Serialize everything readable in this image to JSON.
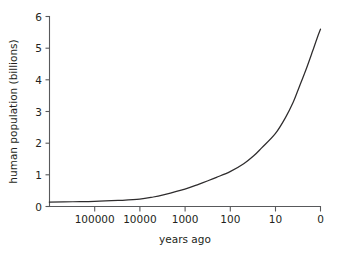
{
  "chart_data": {
    "type": "line",
    "title": "",
    "xlabel": "years ago",
    "ylabel": "human population (billions)",
    "x_scale": "log-reversed",
    "x_tick_labels": [
      "100000",
      "10000",
      "1000",
      "100",
      "10",
      "0"
    ],
    "x_tick_values": [
      100000,
      10000,
      1000,
      100,
      10,
      0
    ],
    "y_tick_labels": [
      "0",
      "1",
      "2",
      "3",
      "4",
      "5",
      "6"
    ],
    "y_tick_values": [
      0,
      1,
      2,
      3,
      4,
      5,
      6
    ],
    "ylim": [
      0,
      6
    ],
    "grid": false,
    "legend": "none",
    "series": [
      {
        "name": "human population",
        "units": "billions",
        "points": [
          {
            "years_ago": 1000000,
            "population": 0.14
          },
          {
            "years_ago": 300000,
            "population": 0.15
          },
          {
            "years_ago": 100000,
            "population": 0.16
          },
          {
            "years_ago": 30000,
            "population": 0.19
          },
          {
            "years_ago": 10000,
            "population": 0.23
          },
          {
            "years_ago": 5000,
            "population": 0.3
          },
          {
            "years_ago": 3000,
            "population": 0.37
          },
          {
            "years_ago": 1000,
            "population": 0.55
          },
          {
            "years_ago": 500,
            "population": 0.7
          },
          {
            "years_ago": 300,
            "population": 0.82
          },
          {
            "years_ago": 200,
            "population": 0.92
          },
          {
            "years_ago": 100,
            "population": 1.1
          },
          {
            "years_ago": 50,
            "population": 1.35
          },
          {
            "years_ago": 30,
            "population": 1.6
          },
          {
            "years_ago": 20,
            "population": 1.85
          },
          {
            "years_ago": 10,
            "population": 2.3
          },
          {
            "years_ago": 6,
            "population": 2.8
          },
          {
            "years_ago": 4,
            "population": 3.3
          },
          {
            "years_ago": 3,
            "population": 3.75
          },
          {
            "years_ago": 2,
            "population": 4.4
          },
          {
            "years_ago": 1.5,
            "population": 4.9
          },
          {
            "years_ago": 1.2,
            "population": 5.3
          },
          {
            "years_ago": 1.0,
            "population": 5.6
          }
        ]
      }
    ]
  },
  "axes": {
    "y_title": "human population (billions)",
    "x_title": "years ago",
    "y_ticks": [
      {
        "label": "6"
      },
      {
        "label": "5"
      },
      {
        "label": "4"
      },
      {
        "label": "3"
      },
      {
        "label": "2"
      },
      {
        "label": "1"
      },
      {
        "label": "0"
      }
    ],
    "x_ticks": [
      {
        "label": "100000"
      },
      {
        "label": "10000"
      },
      {
        "label": "1000"
      },
      {
        "label": "100"
      },
      {
        "label": "10"
      },
      {
        "label": "0"
      }
    ]
  },
  "colors": {
    "background": "#ffffff",
    "axis": "#58595b",
    "curve": "#2e2c2d",
    "text": "#231f20"
  }
}
